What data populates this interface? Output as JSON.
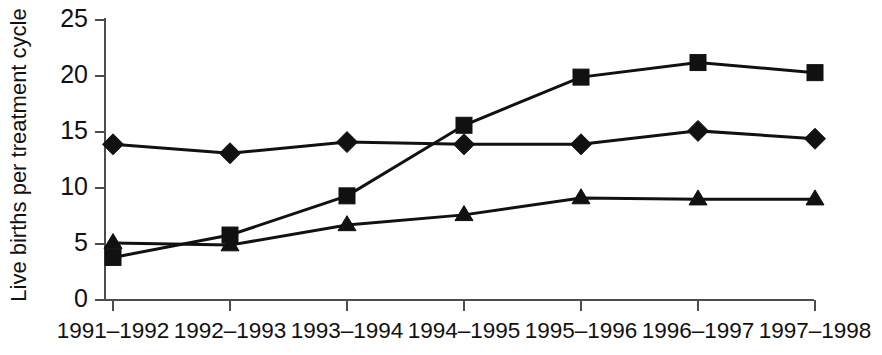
{
  "chart_data": {
    "type": "line",
    "title": "",
    "xlabel": "",
    "ylabel": "Live births per treatment cycle",
    "categories": [
      "1991–1992",
      "1992–1993",
      "1993–1994",
      "1994–1995",
      "1995–1996",
      "1996–1997",
      "1997–1998"
    ],
    "ylim": [
      0,
      25
    ],
    "yticks": [
      0,
      5,
      10,
      15,
      20,
      25
    ],
    "ytick_labels": [
      "0",
      "5",
      "10",
      "15",
      "20",
      "25"
    ],
    "grid": false,
    "legend": "none",
    "series": [
      {
        "name": "diamond-series",
        "marker": "diamond",
        "color": "#111111",
        "values": [
          13.9,
          13.1,
          14.1,
          13.9,
          13.9,
          15.1,
          14.4
        ]
      },
      {
        "name": "square-series",
        "marker": "square",
        "color": "#111111",
        "values": [
          3.8,
          5.8,
          9.3,
          15.6,
          19.9,
          21.2,
          20.3
        ]
      },
      {
        "name": "triangle-series",
        "marker": "triangle",
        "color": "#111111",
        "values": [
          5.1,
          4.9,
          6.7,
          7.6,
          9.1,
          9.0,
          9.0
        ]
      }
    ]
  },
  "axes": {
    "y_axis_label": "Live births per treatment cycle",
    "y_min_label": "0",
    "y_max_label": "25"
  }
}
